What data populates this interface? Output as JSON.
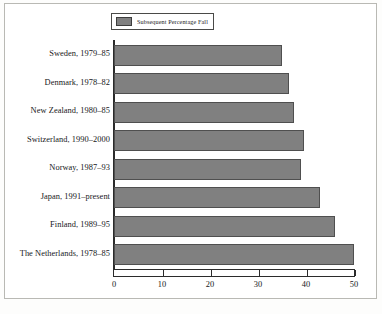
{
  "legend": {
    "label": "Subsequent Percentage Fall",
    "swatch_color": "#808080",
    "position": "top"
  },
  "axis": {
    "x_ticks": [
      "0",
      "10",
      "20",
      "30",
      "40",
      "50"
    ]
  },
  "colors": {
    "bar_fill": "#808080",
    "bar_border": "#4f4f4f",
    "axis": "#2b2b2b",
    "frame": "#b9b9b4",
    "text": "#17171a",
    "background": "#ffffff"
  },
  "chart_data": {
    "type": "bar",
    "orientation": "horizontal",
    "title": "",
    "subtitle": "",
    "xlabel": "",
    "ylabel": "",
    "xlim": [
      0,
      50
    ],
    "grid": false,
    "legend_position": "top",
    "categories": [
      "Sweden, 1979–85",
      "Denmark, 1978–82",
      "New Zealand, 1980–85",
      "Switzerland, 1990–2000",
      "Norway, 1987–93",
      "Japan, 1991–present",
      "Finland, 1989–95",
      "The Netherlands, 1978–85"
    ],
    "series": [
      {
        "name": "Subsequent Percentage Fall",
        "values": [
          35,
          36.5,
          37.5,
          39.5,
          39,
          43,
          46,
          50
        ]
      }
    ],
    "xticks": [
      0,
      10,
      20,
      30,
      40,
      50
    ]
  }
}
